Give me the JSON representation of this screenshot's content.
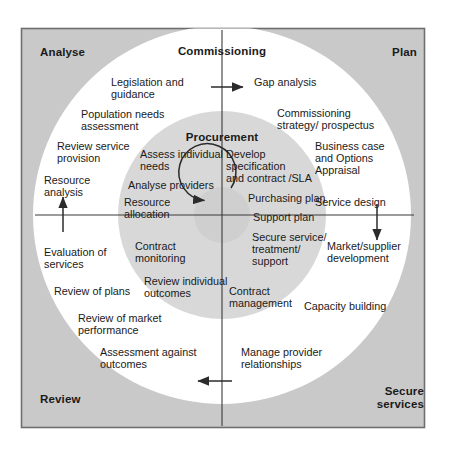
{
  "diagram": {
    "type": "concentric-cycle",
    "colors": {
      "frame_fill": "#c9c9c9",
      "frame_border": "#6e6e6e",
      "outer_ring_fill": "#ffffff",
      "inner_circle_fill": "#d8d8d8",
      "center_circle_fill": "#d0d0d0",
      "line": "#2b2b2b",
      "text": "#1a1a1a",
      "page_background": "#ffffff"
    },
    "geometry": {
      "center_x": 222,
      "center_y": 215,
      "outer_radius": 189,
      "inner_radius": 104,
      "center_radius": 28
    }
  },
  "quadrants": [
    {
      "name": "analyse",
      "label": "Analyse",
      "position": "top-left"
    },
    {
      "name": "plan",
      "label": "Plan",
      "position": "top-right"
    },
    {
      "name": "review",
      "label": "Review",
      "position": "bottom-left"
    },
    {
      "name": "secure-services",
      "label": "Secure\nservices",
      "position": "bottom-right"
    }
  ],
  "ring_titles": {
    "outer": "Commissioning",
    "inner": "Procurement"
  },
  "outer_ring_items": [
    {
      "name": "legislation-and-guidance",
      "label": "Legislation and\nguidance",
      "quadrant": "analyse"
    },
    {
      "name": "population-needs-assessment",
      "label": "Population needs\nassessment",
      "quadrant": "analyse"
    },
    {
      "name": "review-service-provision",
      "label": "Review service\nprovision",
      "quadrant": "analyse"
    },
    {
      "name": "resource-analysis",
      "label": "Resource\nanalysis",
      "quadrant": "analyse"
    },
    {
      "name": "gap-analysis",
      "label": "Gap analysis",
      "quadrant": "plan"
    },
    {
      "name": "commissioning-strategy-prospectus",
      "label": "Commissioning\nstrategy/ prospectus",
      "quadrant": "plan"
    },
    {
      "name": "business-case-and-options-appraisal",
      "label": "Business case\nand Options\nAppraisal",
      "quadrant": "plan"
    },
    {
      "name": "service-design",
      "label": "Service design",
      "quadrant": "plan"
    },
    {
      "name": "market-supplier-development",
      "label": "Market/supplier\ndevelopment",
      "quadrant": "secure-services"
    },
    {
      "name": "capacity-building",
      "label": "Capacity building",
      "quadrant": "secure-services"
    },
    {
      "name": "manage-provider-relationships",
      "label": "Manage provider\nrelationships",
      "quadrant": "secure-services"
    },
    {
      "name": "assessment-against-outcomes",
      "label": "Assessment against\noutcomes",
      "quadrant": "review"
    },
    {
      "name": "review-of-market-performance",
      "label": "Review of market\nperformance",
      "quadrant": "review"
    },
    {
      "name": "review-of-plans",
      "label": "Review of plans",
      "quadrant": "review"
    },
    {
      "name": "evaluation-of-services",
      "label": "Evaluation of\nservices",
      "quadrant": "review"
    }
  ],
  "inner_ring_items": [
    {
      "name": "assess-individual-needs",
      "label": "Assess individual\nneeds",
      "quadrant": "analyse"
    },
    {
      "name": "analyse-providers",
      "label": "Analyse providers",
      "quadrant": "analyse"
    },
    {
      "name": "resource-allocation",
      "label": "Resource\nallocation",
      "quadrant": "analyse"
    },
    {
      "name": "develop-specification-and-contract-sla",
      "label": "Develop\nspecification\nand contract /SLA",
      "quadrant": "plan"
    },
    {
      "name": "purchasing-plan",
      "label": "Purchasing plan",
      "quadrant": "plan"
    },
    {
      "name": "support-plan",
      "label": "Support plan",
      "quadrant": "plan"
    },
    {
      "name": "secure-service-treatment-support",
      "label": "Secure service/\ntreatment/\nsupport",
      "quadrant": "secure-services"
    },
    {
      "name": "contract-management",
      "label": "Contract\nmanagement",
      "quadrant": "secure-services"
    },
    {
      "name": "contract-monitoring",
      "label": "Contract\nmonitoring",
      "quadrant": "review"
    },
    {
      "name": "review-individual-outcomes",
      "label": "Review individual\noutcomes",
      "quadrant": "review"
    }
  ],
  "flow_arrows": [
    {
      "name": "arrow-top-right",
      "direction": "right",
      "meaning": "Commissioning to Plan"
    },
    {
      "name": "arrow-right-down",
      "direction": "down",
      "meaning": "Plan to Secure services"
    },
    {
      "name": "arrow-bottom-left",
      "direction": "left",
      "meaning": "Secure services to Review"
    },
    {
      "name": "arrow-left-up",
      "direction": "up",
      "meaning": "Review to Analyse"
    },
    {
      "name": "arrow-center-circular",
      "direction": "counter-clockwise",
      "meaning": "Procurement inner cycle"
    }
  ]
}
